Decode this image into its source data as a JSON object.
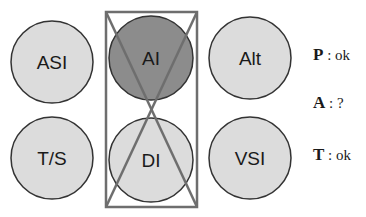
{
  "instruments": [
    {
      "id": "asi",
      "label": "ASI",
      "cx": 52,
      "cy": 62,
      "r": 41,
      "fill": "#dcdcdc"
    },
    {
      "id": "ai",
      "label": "AI",
      "cx": 151,
      "cy": 58,
      "r": 42,
      "fill": "#8c8c8c"
    },
    {
      "id": "alt",
      "label": "Alt",
      "cx": 250,
      "cy": 58,
      "r": 41,
      "fill": "#dcdcdc"
    },
    {
      "id": "ts",
      "label": "T/S",
      "cx": 52,
      "cy": 158,
      "r": 41,
      "fill": "#dcdcdc"
    },
    {
      "id": "di",
      "label": "DI",
      "cx": 151,
      "cy": 160,
      "r": 42,
      "fill": "#dcdcdc"
    },
    {
      "id": "vsi",
      "label": "VSI",
      "cx": 250,
      "cy": 158,
      "r": 41,
      "fill": "#dcdcdc"
    }
  ],
  "highlight_box": {
    "x": 106,
    "y": 12,
    "w": 91,
    "h": 195,
    "stroke": "#6e6e6e"
  },
  "status": [
    {
      "key": "P",
      "sep": " : ",
      "value": "ok"
    },
    {
      "key": "A",
      "sep": " : ",
      "value": "?"
    },
    {
      "key": "T",
      "sep": " : ",
      "value": "ok"
    }
  ]
}
